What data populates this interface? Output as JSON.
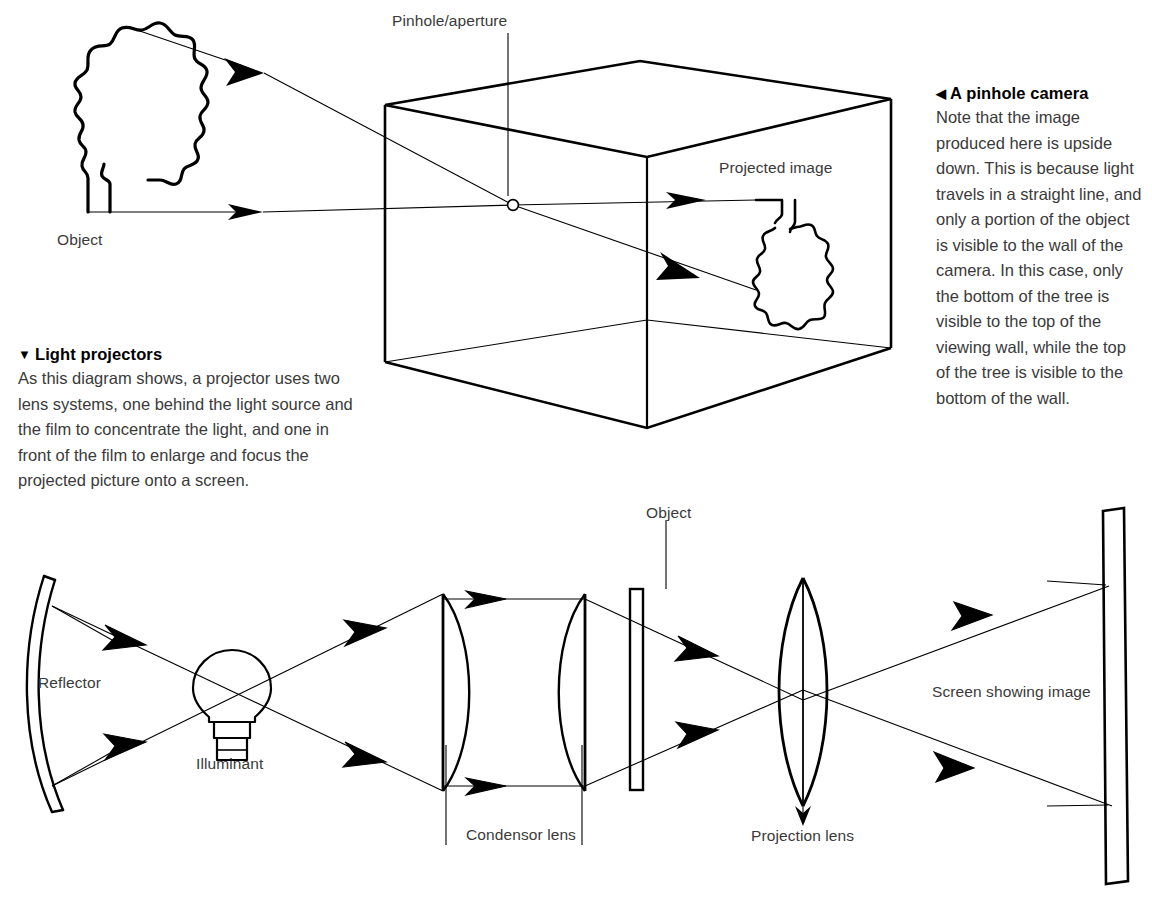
{
  "page": {
    "background_color": "#ffffff",
    "line_color": "#000000",
    "text_color": "#3a3a3a"
  },
  "captions": [
    {
      "id": "pinhole",
      "marker": "◀",
      "heading": "A pinhole camera",
      "body": "Note that the image produced here is upside down. This is because light travels in a straight line, and only a portion of the object is visible to the wall of the camera. In this case, only the bottom of the tree is visible to the top of the viewing wall, while the top of the tree is visible to the bottom of the wall."
    },
    {
      "id": "projector",
      "marker": "▼",
      "heading": "Light projectors",
      "body": "As this diagram shows, a projector uses two lens systems, one behind the light source and the film to concentrate the light, and one in front of the film to enlarge and focus the projected picture onto a screen."
    }
  ],
  "diagrams": [
    {
      "id": "pinhole-camera",
      "name": "Pinhole camera diagram",
      "labels": {
        "pinhole_aperture": "Pinhole/aperture",
        "projected_image": "Projected image",
        "object": "Object"
      },
      "parts": [
        "tree-object",
        "camera-box",
        "pinhole-point",
        "upper-light-ray",
        "lower-light-ray",
        "inverted-tree-image"
      ]
    },
    {
      "id": "light-projector",
      "name": "Light projector diagram",
      "labels": {
        "reflector": "Reflector",
        "illuminant": "Illuminant",
        "condensor_lens": "Condensor lens",
        "object": "Object",
        "projection_lens": "Projection lens",
        "screen": "Screen showing image"
      },
      "parts": [
        "concave-reflector",
        "light-bulb",
        "condensor-lens-left",
        "condensor-lens-right",
        "film-slide",
        "projection-lens",
        "projection-screen",
        "light-rays"
      ]
    }
  ]
}
